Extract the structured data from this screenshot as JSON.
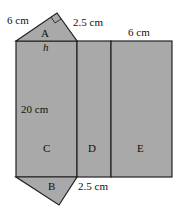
{
  "diagram": {
    "type": "net of triangular prism",
    "fill_color": "#a9a9a9",
    "stroke_color": "#222222",
    "faces": [
      {
        "id": "A",
        "shape": "right triangle",
        "position": "top"
      },
      {
        "id": "B",
        "shape": "right triangle",
        "position": "bottom"
      },
      {
        "id": "C",
        "shape": "rectangle"
      },
      {
        "id": "D",
        "shape": "rectangle"
      },
      {
        "id": "E",
        "shape": "rectangle"
      }
    ],
    "labels": {
      "face_a": "A",
      "face_b": "B",
      "face_c": "C",
      "face_d": "D",
      "face_e": "E",
      "height_symbol": "h",
      "dim_6cm_left": "6 cm",
      "dim_25cm_top": "2.5 cm",
      "dim_6cm_right": "6 cm",
      "dim_20cm": "20 cm",
      "dim_25cm_bottom": "2.5 cm"
    }
  }
}
